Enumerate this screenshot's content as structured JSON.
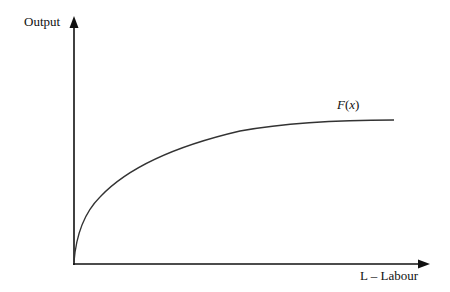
{
  "diagram": {
    "type": "production-function",
    "y_axis": {
      "label": "Output"
    },
    "x_axis": {
      "label": "L – Labour"
    },
    "curve": {
      "label_func": "F",
      "label_open": "(",
      "label_var": "x",
      "label_close": ")",
      "shape": "concave, increasing at a diminishing rate, starting at origin"
    },
    "colors": {
      "axis": "#111111",
      "curve": "#333333",
      "background": "#ffffff"
    }
  }
}
